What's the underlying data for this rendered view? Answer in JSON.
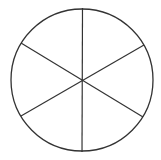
{
  "diagram": {
    "shape": "circle divided into six equal sectors",
    "sectors": 6,
    "stroke_color": "#333333",
    "background_color": "#ffffff",
    "circle": {
      "cx": 82,
      "cy": 80,
      "r": 71
    },
    "lines": [
      {
        "x1": 82.5,
        "y1": 8,
        "x2": 82,
        "y2": 152
      },
      {
        "x1": 21,
        "y1": 43,
        "x2": 143,
        "y2": 117
      },
      {
        "x1": 21,
        "y1": 116,
        "x2": 144,
        "y2": 45
      }
    ]
  }
}
